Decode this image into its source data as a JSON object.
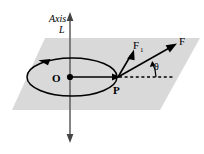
{
  "figure": {
    "labels": {
      "axis": "Axis",
      "axis_name": "L",
      "center": "O",
      "point": "P",
      "force_total": "F",
      "force_component": "F",
      "force_component_sub": "1",
      "angle": "θ"
    },
    "colors": {
      "plane_fill": "#d9d9d9",
      "stroke": "#000000",
      "axis_line": "#555555",
      "background": "#ffffff"
    },
    "geometry": {
      "plane_points": "45,38 200,38 160,110 12,110",
      "axis_x": 70,
      "axis_top_y": 13,
      "axis_bottom_y": 142,
      "ellipse_cx": 72,
      "ellipse_cy": 77,
      "ellipse_rx": 45,
      "ellipse_ry": 19,
      "point_o_x": 70,
      "point_o_y": 77,
      "point_p_x": 118,
      "point_p_y": 77,
      "force_tip_x": 176,
      "force_tip_y": 44,
      "force1_tip_x": 134,
      "force1_tip_y": 51,
      "dashed_end_x": 173,
      "dashed_y": 77,
      "angle_value": "θ"
    }
  }
}
